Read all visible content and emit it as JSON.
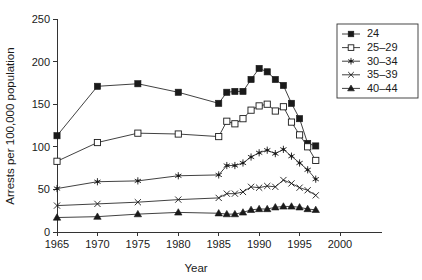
{
  "chart_data": {
    "type": "line",
    "title": "",
    "subtitle": "",
    "xlabel": "Year",
    "ylabel": "Arrests per 100,000 population",
    "xlim": [
      1965,
      2000
    ],
    "ylim": [
      0,
      250
    ],
    "xticks": [
      1965,
      1970,
      1975,
      1980,
      1985,
      1990,
      1995,
      2000
    ],
    "yticks": [
      0,
      50,
      100,
      150,
      200,
      250
    ],
    "grid": false,
    "legend_position": "top-right",
    "series": [
      {
        "name": "24",
        "marker": "filled-square",
        "x": [
          1965,
          1970,
          1975,
          1980,
          1985,
          1986,
          1987,
          1988,
          1989,
          1990,
          1991,
          1992,
          1993,
          1994,
          1995,
          1996,
          1997
        ],
        "values": [
          113,
          171,
          174,
          164,
          151,
          164,
          165,
          165,
          179,
          192,
          188,
          179,
          172,
          151,
          133,
          104,
          101
        ]
      },
      {
        "name": "25–29",
        "marker": "open-square",
        "x": [
          1965,
          1970,
          1975,
          1980,
          1985,
          1986,
          1987,
          1988,
          1989,
          1990,
          1991,
          1992,
          1993,
          1994,
          1995,
          1996,
          1997
        ],
        "values": [
          83,
          105,
          116,
          115,
          112,
          130,
          127,
          133,
          143,
          148,
          150,
          142,
          147,
          129,
          114,
          100,
          84
        ]
      },
      {
        "name": "30–34",
        "marker": "asterisk",
        "x": [
          1965,
          1970,
          1975,
          1980,
          1985,
          1986,
          1987,
          1988,
          1989,
          1990,
          1991,
          1992,
          1993,
          1994,
          1995,
          1996,
          1997
        ],
        "values": [
          51,
          59,
          60,
          66,
          67,
          78,
          78,
          81,
          88,
          93,
          96,
          92,
          97,
          89,
          81,
          73,
          62
        ]
      },
      {
        "name": "35–39",
        "marker": "x-cross",
        "x": [
          1965,
          1970,
          1975,
          1980,
          1985,
          1986,
          1987,
          1988,
          1989,
          1990,
          1991,
          1992,
          1993,
          1994,
          1995,
          1996,
          1997
        ],
        "values": [
          31,
          33,
          35,
          38,
          40,
          45,
          45,
          47,
          53,
          52,
          54,
          53,
          61,
          57,
          52,
          49,
          43
        ]
      },
      {
        "name": "40–44",
        "marker": "filled-triangle",
        "x": [
          1965,
          1970,
          1975,
          1980,
          1985,
          1986,
          1987,
          1988,
          1989,
          1990,
          1991,
          1992,
          1993,
          1994,
          1995,
          1996,
          1997
        ],
        "values": [
          17,
          18,
          21,
          23,
          22,
          21,
          21,
          23,
          26,
          27,
          27,
          29,
          30,
          30,
          29,
          27,
          26
        ]
      }
    ]
  },
  "legend": {
    "items": [
      {
        "label": "24"
      },
      {
        "label": "25–29"
      },
      {
        "label": "30–34"
      },
      {
        "label": "35–39"
      },
      {
        "label": "40–44"
      }
    ]
  },
  "colors": {
    "ink": "#1a1a1a",
    "line": "#2b2b2b",
    "axis": "#333333",
    "background": "#ffffff"
  }
}
